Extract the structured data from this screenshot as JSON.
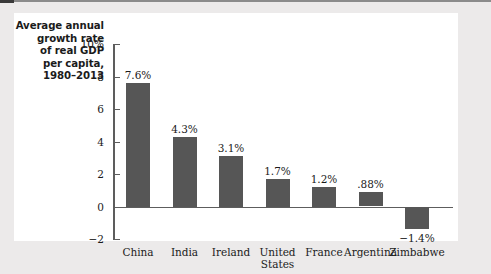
{
  "figure": {
    "caption_lines": [
      "Average annual",
      "growth rate",
      "of real GDP",
      "per capita,",
      "1980–2013"
    ],
    "bar_color": "#565656",
    "panel_color": "#ffffff",
    "background_color": "#eceaea",
    "axis_color": "#5d5d5d"
  },
  "chart_data": {
    "type": "bar",
    "title": "Average annual growth rate of real GDP per capita, 1980–2013",
    "xlabel": "",
    "ylabel": "",
    "ylim": [
      -2,
      10
    ],
    "yticks": [
      10,
      8,
      6,
      4,
      2,
      0,
      -2
    ],
    "ytick_labels": [
      "10%",
      "8",
      "6",
      "4",
      "2",
      "0",
      "−2"
    ],
    "grid": false,
    "legend": false,
    "categories": [
      "China",
      "India",
      "Ireland",
      "United States",
      "France",
      "Argentina",
      "Zimbabwe"
    ],
    "category_label_lines": [
      [
        "China"
      ],
      [
        "India"
      ],
      [
        "Ireland"
      ],
      [
        "United",
        "States"
      ],
      [
        "France"
      ],
      [
        "Argentina"
      ],
      [
        "Zimbabwe"
      ]
    ],
    "values": [
      7.6,
      4.3,
      3.1,
      1.7,
      1.2,
      0.88,
      -1.4
    ],
    "value_labels": [
      "7.6%",
      "4.3%",
      "3.1%",
      "1.7%",
      "1.2%",
      ".88%",
      "−1.4%"
    ]
  }
}
